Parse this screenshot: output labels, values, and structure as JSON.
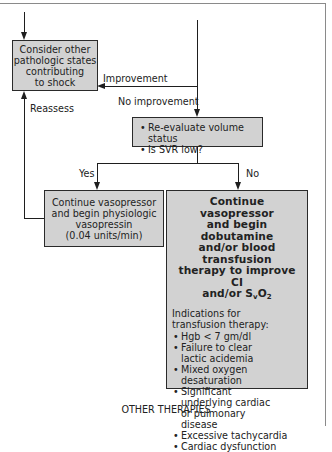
{
  "flowchart": {
    "nodes": {
      "consider_other": {
        "lines": [
          "Consider other",
          "pathologic states",
          "contributing",
          "to shock"
        ]
      },
      "reevaluate": {
        "items": [
          "Re-evaluate volume status",
          "Is SVR low?"
        ]
      },
      "vasopressin": {
        "lines": [
          "Continue vasopressor",
          "and begin physiologic",
          "vasopressin",
          "(0.04 units/min)"
        ]
      },
      "dobutamine": {
        "title_lines": [
          "Continue vasopressor",
          "and begin dobutamine",
          "and/or blood transfusion",
          "therapy to improve CI"
        ],
        "title_last_prefix": "and/or S",
        "title_last_sub": "v",
        "title_last_o": "O",
        "title_last_sub2": "2",
        "indications_heading": "Indications for transfusion therapy:",
        "indications": [
          "Hgb < 7 gm/dl",
          "Failure to clear lactic acidemia",
          "Mixed oxygen desaturation",
          "Significant underlying cardiac or pulmonary disease",
          "Excessive tachycardia",
          "Cardiac dysfunction"
        ]
      }
    },
    "edge_labels": {
      "improvement": "Improvement",
      "no_improvement": "No improvement",
      "reassess": "Reassess",
      "yes": "Yes",
      "no": "No"
    },
    "footer": "OTHER THERAPIES"
  }
}
